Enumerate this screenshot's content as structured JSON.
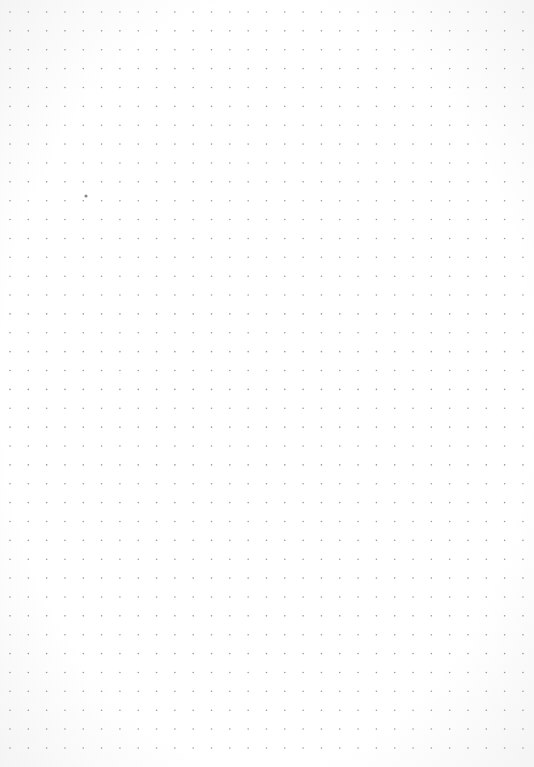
{
  "page": {
    "type": "dot-grid paper",
    "background_color": "#ffffff",
    "dot_color": "#9a9a9a",
    "grid": {
      "columns": 29,
      "rows": 40,
      "origin_x": 10,
      "origin_y": 12,
      "spacing_x": 18.32,
      "spacing_y": 18.87,
      "dot_radius": 0.8
    },
    "stray_mark": {
      "x": 86,
      "y": 196,
      "radius": 1.6,
      "color": "#8a8a8a"
    }
  }
}
